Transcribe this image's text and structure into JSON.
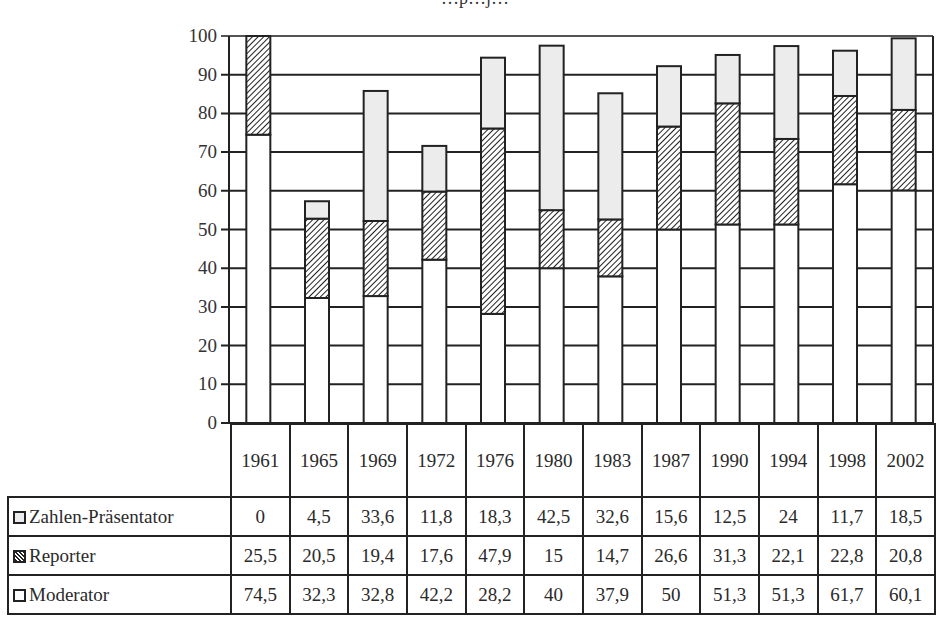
{
  "chart_data": {
    "type": "bar",
    "stacked": true,
    "title": "…p…j…",
    "xlabel": "",
    "ylabel": "",
    "ylim": [
      0,
      100
    ],
    "yticks": [
      0,
      10,
      20,
      30,
      40,
      50,
      60,
      70,
      80,
      90,
      100
    ],
    "grid": true,
    "legend_position": "data-table-left",
    "categories": [
      "1961",
      "1965",
      "1969",
      "1972",
      "1976",
      "1980",
      "1983",
      "1987",
      "1990",
      "1994",
      "1998",
      "2002"
    ],
    "series": [
      {
        "name": "Moderator",
        "pattern": "white",
        "color": "#ffffff",
        "values": [
          74.5,
          32.3,
          32.8,
          42.2,
          28.2,
          40,
          37.9,
          50,
          51.3,
          51.3,
          61.7,
          60.1
        ]
      },
      {
        "name": "Reporter",
        "pattern": "diagonal-hatch",
        "color": "#222222",
        "values": [
          25.5,
          20.5,
          19.4,
          17.6,
          47.9,
          15,
          14.7,
          26.6,
          31.3,
          22.1,
          22.8,
          20.8
        ]
      },
      {
        "name": "Zahlen-Präsentator",
        "pattern": "light-gray",
        "color": "#ececec",
        "values": [
          0,
          4.5,
          33.6,
          11.8,
          18.3,
          42.5,
          32.6,
          15.6,
          12.5,
          24,
          11.7,
          18.5
        ]
      }
    ]
  },
  "table": {
    "years": [
      "1961",
      "1965",
      "1969",
      "1972",
      "1976",
      "1980",
      "1983",
      "1987",
      "1990",
      "1994",
      "1998",
      "2002"
    ],
    "rows": [
      {
        "label": "Zahlen-Präsentator",
        "legend": "light-gray-box",
        "values": [
          "0",
          "4,5",
          "33,6",
          "11,8",
          "18,3",
          "42,5",
          "32,6",
          "15,6",
          "12,5",
          "24",
          "11,7",
          "18,5"
        ]
      },
      {
        "label": "Reporter",
        "legend": "hatched-box",
        "values": [
          "25,5",
          "20,5",
          "19,4",
          "17,6",
          "47,9",
          "15",
          "14,7",
          "26,6",
          "31,3",
          "22,1",
          "22,8",
          "20,8"
        ]
      },
      {
        "label": "Moderator",
        "legend": "white-box",
        "values": [
          "74,5",
          "32,3",
          "32,8",
          "42,2",
          "28,2",
          "40",
          "37,9",
          "50",
          "51,3",
          "51,3",
          "61,7",
          "60,1"
        ]
      }
    ]
  },
  "colors": {
    "zahlen": "#ececec",
    "reporter_hatch": "#222222",
    "moderator": "#ffffff",
    "lines": "#222222"
  }
}
